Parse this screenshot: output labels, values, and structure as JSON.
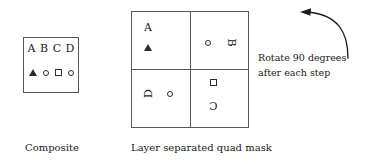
{
  "diagram": {
    "composite": {
      "caption": "Composite",
      "letters": [
        "A",
        "B",
        "C",
        "D"
      ],
      "shapes": [
        "triangle",
        "circle",
        "square",
        "circle"
      ]
    },
    "quad_mask": {
      "caption": "Layer separated quad mask",
      "quadrants": [
        {
          "position": "top-left",
          "letter": "A",
          "letter_rotation_degrees": 0,
          "shape": "triangle"
        },
        {
          "position": "top-right",
          "letter": "B",
          "letter_rotation_degrees": 90,
          "shape": "circle"
        },
        {
          "position": "bottom-left",
          "letter": "D",
          "letter_rotation_degrees": -90,
          "shape": "circle"
        },
        {
          "position": "bottom-right",
          "letter": "C",
          "letter_rotation_degrees": 180,
          "shape": "square"
        }
      ]
    },
    "annotation": {
      "line1": "Rotate 90 degrees",
      "line2": "after each step",
      "arrow": "curved-arrow-counterclockwise"
    },
    "colors": {
      "stroke": "#555a5e",
      "ink": "#1a1a1a",
      "background": "#ffffff"
    }
  }
}
